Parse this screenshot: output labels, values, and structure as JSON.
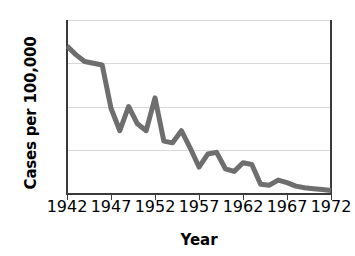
{
  "chart_data": {
    "type": "line",
    "title": "",
    "xlabel": "Year",
    "ylabel": "Cases per 100,000",
    "xlim": [
      1942,
      1972
    ],
    "ylim": [
      0,
      200
    ],
    "grid": true,
    "legend": false,
    "series_color": "#6e6e6e",
    "x": [
      1942,
      1943,
      1944,
      1945,
      1946,
      1947,
      1948,
      1949,
      1950,
      1951,
      1952,
      1953,
      1954,
      1955,
      1956,
      1957,
      1958,
      1959,
      1960,
      1961,
      1962,
      1963,
      1964,
      1965,
      1966,
      1967,
      1968,
      1969,
      1970,
      1971,
      1972
    ],
    "values": [
      170,
      160,
      152,
      150,
      148,
      98,
      72,
      100,
      80,
      72,
      110,
      60,
      58,
      72,
      52,
      30,
      45,
      47,
      28,
      25,
      35,
      33,
      10,
      9,
      15,
      12,
      8,
      6,
      5,
      4,
      3
    ],
    "series": [
      {
        "name": "Cases per 100,000",
        "values": [
          170,
          160,
          152,
          150,
          148,
          98,
          72,
          100,
          80,
          72,
          110,
          60,
          58,
          72,
          52,
          30,
          45,
          47,
          28,
          25,
          35,
          33,
          10,
          9,
          15,
          12,
          8,
          6,
          5,
          4,
          3
        ]
      }
    ],
    "ytick_labels": [
      "0",
      "50",
      "100",
      "150",
      "200"
    ],
    "ytick_values": [
      0,
      50,
      100,
      150,
      200
    ],
    "xtick_labels": [
      "1942",
      "1947",
      "1952",
      "1957",
      "1962",
      "1967",
      "1972"
    ],
    "xtick_values": [
      1942,
      1947,
      1952,
      1957,
      1962,
      1967,
      1972
    ]
  }
}
